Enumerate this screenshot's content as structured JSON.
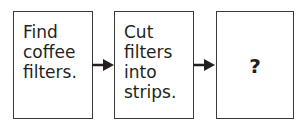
{
  "diagram": {
    "type": "flowchart",
    "steps": [
      {
        "label": "Find coffee filters.",
        "lines": [
          "Find",
          "coffee",
          "filters."
        ]
      },
      {
        "label": "Cut filters into strips.",
        "lines": [
          "Cut",
          "filters",
          "into",
          "strips."
        ]
      },
      {
        "label": "?",
        "lines": [
          "?"
        ]
      }
    ],
    "connectors": [
      {
        "from": 0,
        "to": 1,
        "type": "arrow"
      },
      {
        "from": 1,
        "to": 2,
        "type": "arrow"
      }
    ]
  }
}
